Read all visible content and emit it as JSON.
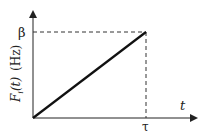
{
  "diagram": {
    "y_label_main": "F",
    "y_label_sub": "i",
    "y_label_arg": "(t)",
    "y_label_unit": "(Hz)",
    "x_label": "t",
    "y_tick": "β",
    "x_tick": "τ",
    "line_color": "#111111",
    "axis_color": "#222222"
  }
}
